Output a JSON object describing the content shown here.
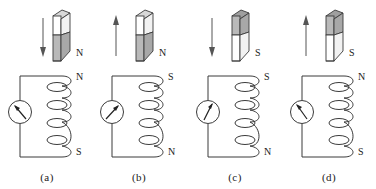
{
  "figure": {
    "type": "physics-diagram",
    "panel_count": 4,
    "colors": {
      "stroke": "#3b3b3b",
      "magnet_pole_fill": "#b9b9b9",
      "magnet_plain_fill": "#ffffff",
      "magnet_top_face_fill": "#d8d8d8",
      "background": "#ffffff"
    }
  },
  "panels": [
    {
      "caption": "(a)",
      "magnet": {
        "top_half_shade": "white",
        "bottom_half_shade": "gray",
        "pole_label": "N",
        "pole_label_position": "bottom-right",
        "motion_arrow": "down"
      },
      "coil": {
        "top_label": "N",
        "bottom_label": "S",
        "turns": 4
      },
      "meter": {
        "name": "galvanometer",
        "needle": "up-left"
      }
    },
    {
      "caption": "(b)",
      "magnet": {
        "top_half_shade": "white",
        "bottom_half_shade": "gray",
        "pole_label": "N",
        "pole_label_position": "bottom-right",
        "motion_arrow": "up"
      },
      "coil": {
        "top_label": "S",
        "bottom_label": "N",
        "turns": 4
      },
      "meter": {
        "name": "galvanometer",
        "needle": "up-right"
      }
    },
    {
      "caption": "(c)",
      "magnet": {
        "top_half_shade": "gray",
        "bottom_half_shade": "white",
        "pole_label": "S",
        "pole_label_position": "bottom-right",
        "motion_arrow": "down"
      },
      "coil": {
        "top_label": "S",
        "bottom_label": "N",
        "turns": 4
      },
      "meter": {
        "name": "galvanometer",
        "needle": "up-right"
      }
    },
    {
      "caption": "(d)",
      "magnet": {
        "top_half_shade": "gray",
        "bottom_half_shade": "white",
        "pole_label": "S",
        "pole_label_position": "bottom-right",
        "motion_arrow": "up"
      },
      "coil": {
        "top_label": "N",
        "bottom_label": "S",
        "turns": 4
      },
      "meter": {
        "name": "galvanometer",
        "needle": "up-left"
      }
    }
  ]
}
